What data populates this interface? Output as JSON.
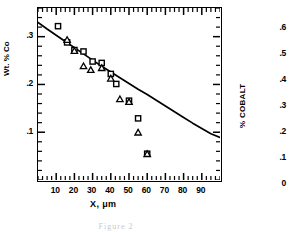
{
  "figure": {
    "caption": "Figure 2"
  },
  "main_chart": {
    "y_axis_title": "Wt. % Co",
    "x_axis_title": "X, μm",
    "y_tick_labels": [
      ".3",
      ".2",
      ".1"
    ],
    "x_tick_labels": [
      "10",
      "20",
      "30",
      "40",
      "50",
      "60",
      "70",
      "80",
      "90"
    ]
  },
  "side_chart": {
    "axis_title": "% COBALT",
    "tick_labels": [
      ".6",
      ".5",
      ".4",
      ".3",
      ".2",
      ".1",
      "0"
    ]
  },
  "chart_data": {
    "type": "scatter",
    "title": "",
    "xlabel": "X, μm",
    "ylabel": "Wt. % Co",
    "xlim": [
      0,
      100
    ],
    "ylim": [
      0.0,
      0.36
    ],
    "grid": false,
    "legend": "none",
    "x_ticks": [
      10,
      20,
      30,
      40,
      50,
      60,
      70,
      80,
      90
    ],
    "x_minor_tick_step": 2.5,
    "y_ticks": [
      0.1,
      0.2,
      0.3
    ],
    "y_minor_tick_step": 0.02,
    "series": [
      {
        "name": "squares",
        "marker": "open-square",
        "points": [
          {
            "x": 11,
            "y": 0.322
          },
          {
            "x": 16,
            "y": 0.288
          },
          {
            "x": 20,
            "y": 0.272
          },
          {
            "x": 25,
            "y": 0.269
          },
          {
            "x": 30,
            "y": 0.248
          },
          {
            "x": 35,
            "y": 0.245
          },
          {
            "x": 40,
            "y": 0.222
          },
          {
            "x": 43,
            "y": 0.201
          },
          {
            "x": 50,
            "y": 0.166
          },
          {
            "x": 55,
            "y": 0.129
          },
          {
            "x": 60,
            "y": 0.055
          }
        ]
      },
      {
        "name": "triangles",
        "marker": "open-triangle",
        "points": [
          {
            "x": 16,
            "y": 0.294
          },
          {
            "x": 20,
            "y": 0.271
          },
          {
            "x": 25,
            "y": 0.239
          },
          {
            "x": 29,
            "y": 0.231
          },
          {
            "x": 35,
            "y": 0.235
          },
          {
            "x": 40,
            "y": 0.213
          },
          {
            "x": 45,
            "y": 0.17
          },
          {
            "x": 50,
            "y": 0.164
          },
          {
            "x": 55,
            "y": 0.1
          },
          {
            "x": 60,
            "y": 0.055
          }
        ]
      }
    ],
    "fit_curve": {
      "name": "model-curve",
      "style": "solid",
      "points": [
        {
          "x": 0,
          "y": 0.33
        },
        {
          "x": 5,
          "y": 0.316
        },
        {
          "x": 10,
          "y": 0.303
        },
        {
          "x": 15,
          "y": 0.29
        },
        {
          "x": 20,
          "y": 0.277
        },
        {
          "x": 25,
          "y": 0.264
        },
        {
          "x": 30,
          "y": 0.251
        },
        {
          "x": 35,
          "y": 0.238
        },
        {
          "x": 40,
          "y": 0.226
        },
        {
          "x": 45,
          "y": 0.214
        },
        {
          "x": 50,
          "y": 0.202
        },
        {
          "x": 55,
          "y": 0.19
        },
        {
          "x": 60,
          "y": 0.179
        },
        {
          "x": 65,
          "y": 0.167
        },
        {
          "x": 70,
          "y": 0.155
        },
        {
          "x": 75,
          "y": 0.143
        },
        {
          "x": 80,
          "y": 0.131
        },
        {
          "x": 85,
          "y": 0.119
        },
        {
          "x": 90,
          "y": 0.108
        },
        {
          "x": 95,
          "y": 0.097
        },
        {
          "x": 100,
          "y": 0.089
        }
      ]
    }
  }
}
